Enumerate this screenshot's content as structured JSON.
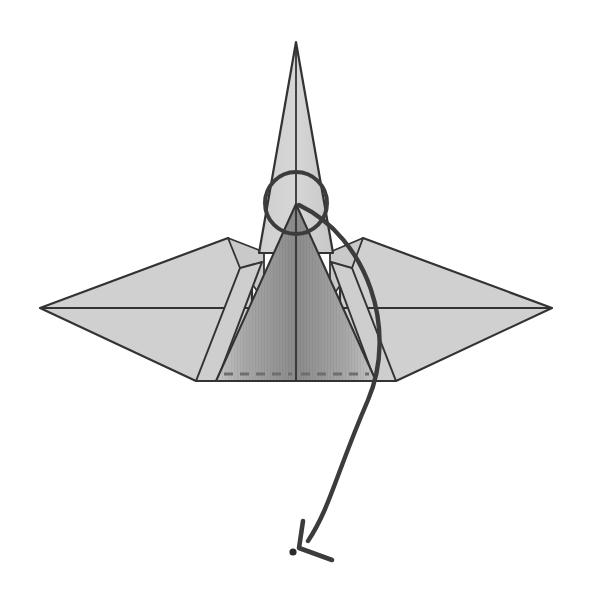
{
  "document": {
    "title": "Origami Fold Diagram",
    "subject": "paper-crane-like model, front view",
    "background_color": "#ffffff",
    "width": 592,
    "height": 598
  },
  "palette": {
    "paper_light": "#d0d0d0",
    "paper_light_alt": "#c9c9c9",
    "paper_mid": "#b9b9b9",
    "shaded_panel_dark": "#8a8a8a",
    "shaded_panel_light": "#c4c4c4",
    "line_color": "#333333",
    "arrow_color": "#3c3c3c",
    "dash_color": "#6e6e6e",
    "dot_color": "#2b2b2b",
    "background": "#ffffff"
  },
  "strokes": {
    "outline_width": 2.2,
    "crease_width": 1.8,
    "arrow_width": 4.2,
    "circle_width": 4.0,
    "dash_width": 3.2,
    "dash_pattern": "9 7"
  },
  "shapes": {
    "spike": {
      "name": "top-spike",
      "label": "tall pointed beak flap",
      "apex": [
        296,
        42
      ],
      "left_base": [
        262,
        252
      ],
      "right_base": [
        332,
        252
      ],
      "center_line_top": [
        296,
        42
      ],
      "center_line_bottom": [
        296,
        252
      ],
      "fill": "#d0d0d0"
    },
    "left_wing": {
      "name": "left-wing",
      "label": "left wing flap",
      "points": "40,308 228,238 252,262 252,380 195,380",
      "fill": "#d0d0d0",
      "midline_from": [
        40,
        308
      ],
      "midline_to": [
        252,
        308
      ]
    },
    "right_wing": {
      "name": "right-wing",
      "label": "right wing flap",
      "points": "552,308 363,238 340,262 340,380 396,380",
      "fill": "#d0d0d0",
      "midline_from": [
        552,
        308
      ],
      "midline_to": [
        340,
        308
      ]
    },
    "left_shoulder": {
      "name": "left-shoulder-panel",
      "points": "228,238 262,252 262,300 240,268",
      "fill": "#c9c9c9"
    },
    "right_shoulder": {
      "name": "right-shoulder-panel",
      "points": "363,238 332,252 332,300 352,268",
      "fill": "#c9c9c9"
    },
    "body_trapezoid": {
      "name": "body-trapezoid",
      "label": "lower body panel",
      "points": "296,205 375,380 217,380",
      "fill_stops": [
        {
          "offset": 0,
          "color": "#c6c6c6"
        },
        {
          "offset": 0.5,
          "color": "#8a8a8a"
        },
        {
          "offset": 1,
          "color": "#c6c6c6"
        }
      ]
    },
    "body_skirt_left": {
      "name": "body-skirt-left",
      "points": "217,380 195,380 240,268 262,300",
      "fill": "#cecece"
    },
    "body_skirt_right": {
      "name": "body-skirt-right",
      "points": "375,380 396,380 352,268 332,300",
      "fill": "#cecece"
    },
    "center_fold_line": {
      "name": "center-fold-line",
      "from": [
        296,
        205
      ],
      "to": [
        296,
        380
      ]
    },
    "dashed_fold": {
      "name": "dashed-valley-fold",
      "label": "valley fold guide near bottom edge",
      "from": [
        222,
        374
      ],
      "to": [
        370,
        374
      ]
    },
    "bottom_edge": {
      "name": "bottom-edge",
      "from": [
        195,
        380
      ],
      "to": [
        396,
        380
      ]
    }
  },
  "annotations": {
    "circle_marker": {
      "name": "highlight-circle",
      "label": "circled reference point at fold apex",
      "center": [
        296,
        203
      ],
      "radius": 31,
      "stroke": "#3c3c3c",
      "stroke_width": 4
    },
    "arrow": {
      "name": "fold-direction-arrow",
      "label": "large curved arrow showing flap swinging down and to the left",
      "path": "M 299 205 C 368 238 398 330 368 400 C 336 474 330 508 308 541",
      "stroke": "#3c3c3c",
      "stroke_width": 4.4,
      "head": {
        "tip": [
          299,
          548
        ],
        "barb_a": [
          303,
          521
        ],
        "barb_b": [
          332,
          560
        ]
      }
    },
    "target_dot": {
      "name": "target-point-dot",
      "label": "destination reference dot",
      "center": [
        293,
        552
      ],
      "radius": 3.6,
      "fill": "#2b2b2b"
    }
  },
  "legend": {
    "caption": "",
    "notes": ""
  }
}
